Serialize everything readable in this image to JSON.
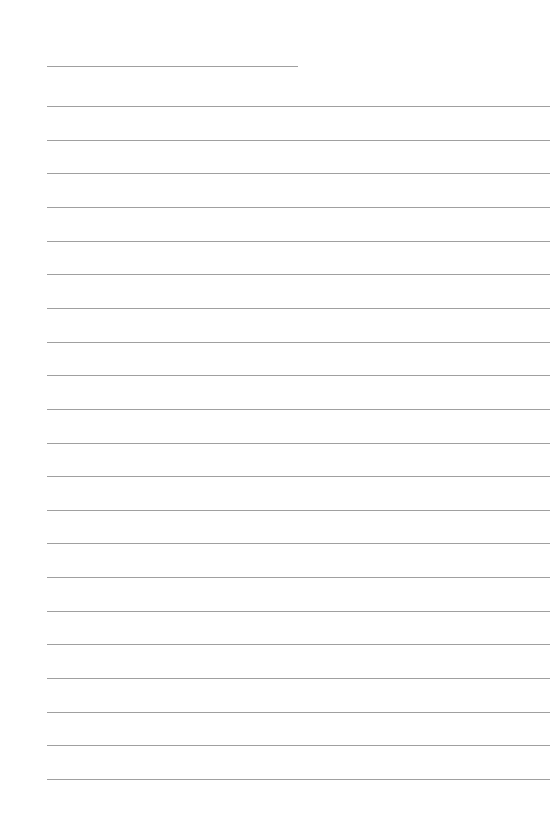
{
  "page": {
    "type": "lined-paper",
    "background_color": "#ffffff",
    "line_color": "#a0a0a0",
    "header_line": {
      "x": 47,
      "y": 66,
      "width": 251
    },
    "body_lines": {
      "x": 47,
      "width": 503,
      "first_y": 106,
      "spacing": 33.65,
      "count": 21
    }
  }
}
